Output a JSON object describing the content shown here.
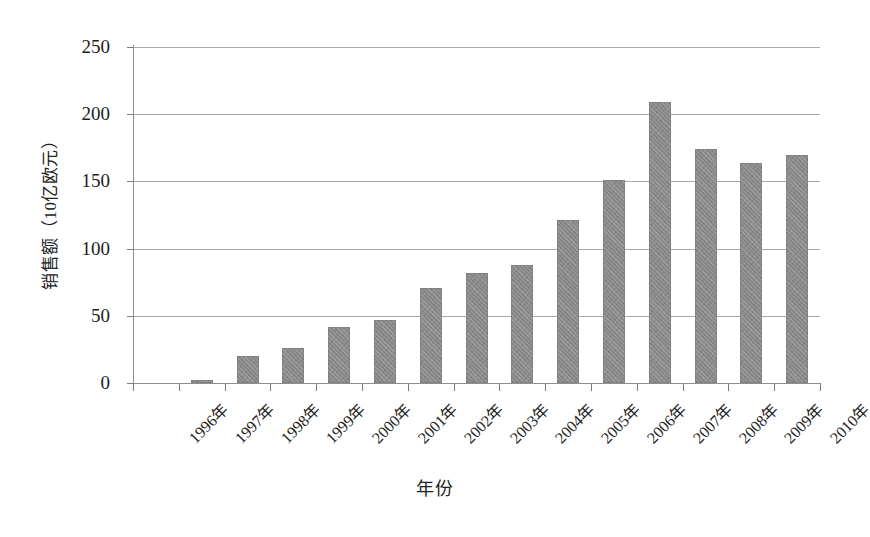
{
  "chart_data": {
    "type": "bar",
    "title": "",
    "xlabel": "年份",
    "ylabel": "销售额（10亿欧元）",
    "categories": [
      "1996年",
      "1997年",
      "1998年",
      "1999年",
      "2000年",
      "2001年",
      "2002年",
      "2003年",
      "2004年",
      "2005年",
      "2006年",
      "2007年",
      "2008年",
      "2009年",
      "2010年"
    ],
    "values": [
      0,
      2,
      20,
      26,
      42,
      47,
      71,
      82,
      88,
      121,
      151,
      209,
      174,
      164,
      170
    ],
    "ylim": [
      0,
      250
    ],
    "yticks": [
      0,
      50,
      100,
      150,
      200,
      250
    ],
    "ytick_labels": [
      "0",
      "50",
      "100",
      "150",
      "200",
      "250"
    ],
    "grid": true,
    "legend": false,
    "bar_color": "#8a8a8a",
    "gridline_color": "#9a9a9a",
    "axis_color": "#8e8e8e",
    "background": "#ffffff"
  }
}
